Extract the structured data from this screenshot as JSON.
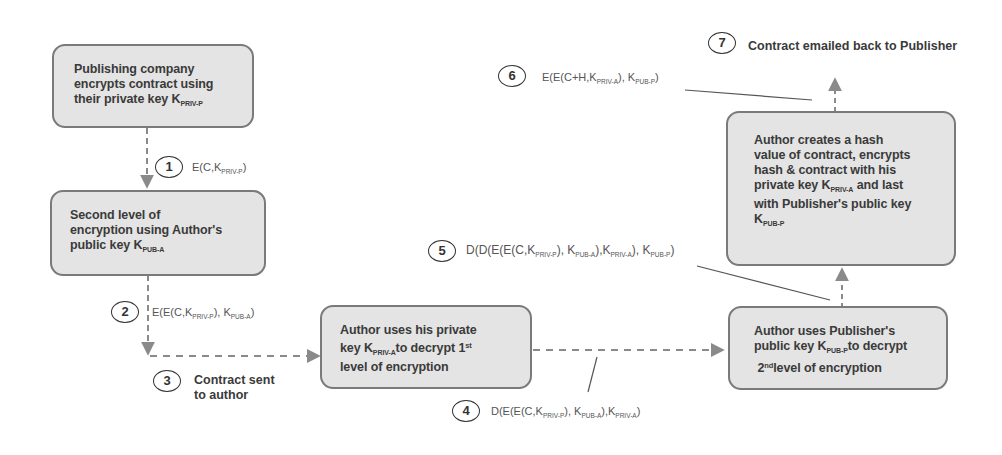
{
  "diagram": {
    "colors": {
      "box_fill": "#e4e4e4",
      "box_border": "#7a7a7a",
      "arrow": "#8a8a8a",
      "text": "#3a3a3a"
    },
    "boxes": [
      {
        "id": "publisher-encrypts",
        "lines": [
          "Publishing company",
          "encrypts contract using",
          "their private key K"
        ],
        "key_sub": "PRIV-P"
      },
      {
        "id": "second-level",
        "lines": [
          "Second level of",
          "encryption using Author's",
          "public key K"
        ],
        "key_sub": "PUB-A"
      },
      {
        "id": "author-decrypt-1",
        "line1": "Author uses his private",
        "line2_pre": "key K",
        "line2_sub": "PRIV-A",
        "line2_post": "to decrypt 1",
        "line2_sup": "st",
        "line3": "level of encryption"
      },
      {
        "id": "author-decrypt-2",
        "line1": "Author uses Publisher's",
        "line2_pre": "public key K",
        "line2_sub": "PUB-P",
        "line2_post": "to decrypt",
        "line3_pre": "2",
        "line3_sup": "nd",
        "line3_post": "level of encryption"
      },
      {
        "id": "author-hash",
        "line1": "Author creates a hash",
        "line2": "value of contract, encrypts",
        "line3": "hash & contract with his",
        "line4_pre": "private key K",
        "line4_sub": "PRIV-A",
        "line4_post": " and last",
        "line5": " with Publisher's public key",
        "line6_pre": "K",
        "line6_sub": "PUB-P"
      }
    ],
    "steps": [
      {
        "num": "1",
        "formula": {
          "p1": "E(C,K",
          "s1": "PRIV-P",
          "p2": ")"
        }
      },
      {
        "num": "2",
        "formula": {
          "p1": "E(E(C,K",
          "s1": "PRIV-P",
          "p2": "), K",
          "s2": "PUB-A",
          "p3": ")"
        }
      },
      {
        "num": "3",
        "text_lines": [
          "Contract sent",
          "to author"
        ]
      },
      {
        "num": "4",
        "formula": {
          "p1": "D(E(E(C,K",
          "s1": "PRIV-P",
          "p2": "), K",
          "s2": "PUB-A",
          "p3": "),K",
          "s3": "PRIV-A",
          "p4": ")"
        }
      },
      {
        "num": "5",
        "formula": {
          "p1": "D(D(E(E(C,K",
          "s1": "PRIV-P",
          "p2": "), K",
          "s2": "PUB-A",
          "p3": "),K",
          "s3": "PRIV-A",
          "p4": "), K",
          "s4": "PUB-P",
          "p5": ")"
        }
      },
      {
        "num": "6",
        "formula": {
          "p1": "E(E(C+H,K",
          "s1": "PRIV-A",
          "p2": "), K",
          "s2": "PUB-P",
          "p3": ")"
        }
      },
      {
        "num": "7",
        "text": "Contract emailed back to Publisher"
      }
    ]
  }
}
